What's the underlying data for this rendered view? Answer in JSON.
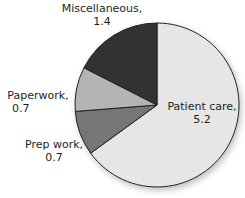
{
  "chart_data": {
    "type": "pie",
    "title": "",
    "categories": [
      "Patient care",
      "Prep work",
      "Paperwork",
      "Miscellaneous"
    ],
    "values": [
      5.2,
      0.7,
      0.7,
      1.4
    ],
    "colors": [
      "#e6e6e6",
      "#767676",
      "#b4b4b4",
      "#333333"
    ],
    "start_angle_deg": 0,
    "direction": "clockwise",
    "labels": [
      {
        "name": "Patient care,",
        "value": "5.2"
      },
      {
        "name": "Prep work,",
        "value": "0.7"
      },
      {
        "name": "Paperwork,",
        "value": "0.7"
      },
      {
        "name": "Miscellaneous,",
        "value": "1.4"
      }
    ],
    "legend": "none"
  }
}
